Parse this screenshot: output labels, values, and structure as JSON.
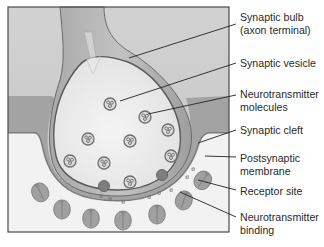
{
  "diagram": {
    "labels": [
      {
        "id": "synaptic-bulb",
        "line1": "Synaptic bulb",
        "line2": "(axon terminal)",
        "top": 11
      },
      {
        "id": "synaptic-vesicle",
        "line1": "Synaptic vesicle",
        "line2": "",
        "top": 55
      },
      {
        "id": "neurotransmitter-molecules",
        "line1": "Neurotransmitter",
        "line2": "molecules",
        "top": 87
      },
      {
        "id": "synaptic-cleft",
        "line1": "Synaptic cleft",
        "line2": "",
        "top": 124
      },
      {
        "id": "postsynaptic-membrane",
        "line1": "Postsynaptic",
        "line2": "membrane",
        "top": 150
      },
      {
        "id": "receptor-site",
        "line1": "Receptor site",
        "line2": "",
        "top": 185
      },
      {
        "id": "neurotransmitter-binding",
        "line1": "Neurotransmitter",
        "line2": "binding",
        "top": 213
      }
    ],
    "colors": {
      "frame_border": "#4a4a4a",
      "background_top": "#cfcfcf",
      "postsynaptic_region": "#f3f3f3",
      "membrane": "#8f8f8f",
      "membrane_dark": "#6a6a6a",
      "bulb_interior": "#ececec",
      "axon": "#b8b8b8",
      "receptor": "#9a9a9a",
      "leader_line": "#222222",
      "label_text": "#2a2a2a"
    }
  }
}
